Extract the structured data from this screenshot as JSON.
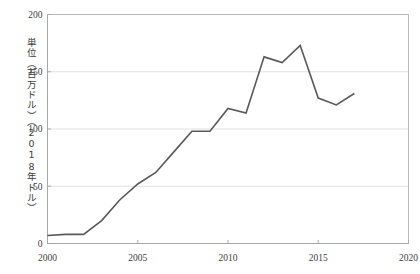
{
  "chart_data": {
    "type": "line",
    "title": "",
    "subtitle": "",
    "xlabel": "",
    "ylabel": "単位（百万ドル）（2018年ドル）",
    "x": [
      2000,
      2001,
      2002,
      2003,
      2004,
      2005,
      2006,
      2007,
      2008,
      2009,
      2010,
      2011,
      2012,
      2013,
      2014,
      2015,
      2016,
      2017
    ],
    "values": [
      7,
      8,
      8,
      20,
      38,
      52,
      62,
      80,
      98,
      98,
      118,
      114,
      163,
      158,
      173,
      127,
      121,
      131
    ],
    "series": [
      {
        "name": "series-1",
        "values": [
          7,
          8,
          8,
          20,
          38,
          52,
          62,
          80,
          98,
          98,
          118,
          114,
          163,
          158,
          173,
          127,
          121,
          131
        ]
      }
    ],
    "xlim": [
      2000,
      2020
    ],
    "ylim": [
      0,
      200
    ],
    "xticks": [
      "2000",
      "2005",
      "2010",
      "2015",
      "2020"
    ],
    "xtick_values": [
      2000,
      2005,
      2010,
      2015,
      2020
    ],
    "yticks": [
      "0",
      "50",
      "100",
      "150",
      "200"
    ],
    "ytick_values": [
      0,
      50,
      100,
      150,
      200
    ],
    "grid": "horizontal",
    "legend": "none",
    "line_color": "#595959",
    "line_width": 1.6,
    "grid_color": "#d9d9d9",
    "axis_color": "#a6a6a6",
    "background": "#ffffff",
    "markers": "none",
    "annotations": []
  },
  "axis": {
    "y_title": "単位（百万ドル）（2018年ドル）"
  }
}
